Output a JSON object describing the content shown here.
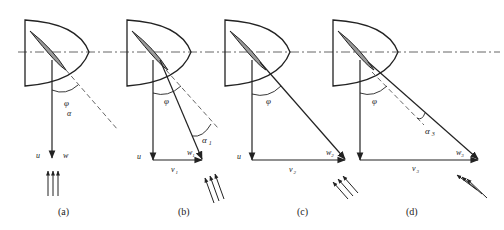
{
  "figure": {
    "axis_line": "dash-dot horizontal axis",
    "panels": [
      {
        "id": "a",
        "caption": "(a)",
        "labels": {
          "angle": "φ",
          "angle_sub": "α",
          "u": "u",
          "w": "w"
        }
      },
      {
        "id": "b",
        "caption": "(b)",
        "labels": {
          "angle": "φ",
          "alpha": "α",
          "alpha_sub": "1",
          "u": "u",
          "w": "w",
          "w_sub": "1",
          "v": "v",
          "v_sub": "1"
        }
      },
      {
        "id": "c",
        "caption": "(c)",
        "labels": {
          "angle": "φ",
          "u": "u",
          "w": "w",
          "w_sub": "2",
          "v": "v",
          "v_sub": "2"
        }
      },
      {
        "id": "d",
        "caption": "(d)",
        "labels": {
          "angle": "φ",
          "alpha": "α",
          "alpha_sub": "3",
          "u": "u",
          "w": "w",
          "w_sub": "3",
          "v": "v",
          "v_sub": "3"
        }
      }
    ],
    "colors": {
      "stroke": "#222222",
      "blade_fill": "#9a9a9a",
      "background": "#ffffff"
    }
  }
}
